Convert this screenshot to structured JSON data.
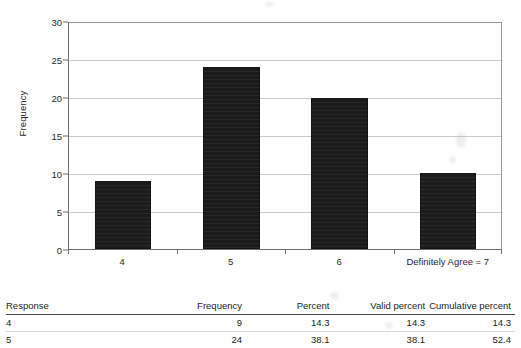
{
  "chart_data": {
    "type": "bar",
    "title": "",
    "xlabel": "",
    "ylabel": "Frequency",
    "categories": [
      "4",
      "5",
      "6",
      "Definitely Agree = 7"
    ],
    "values": [
      9,
      24,
      20,
      10
    ],
    "ylim": [
      0,
      30
    ],
    "yticks": [
      0,
      5,
      10,
      15,
      20,
      25,
      30
    ],
    "ytick_labels": [
      "0",
      "5",
      "10",
      "15",
      "20",
      "25",
      "30"
    ],
    "grid": true,
    "legend": "none",
    "bar_color": "#1b1b1b",
    "gridline_color": "#c9c9c9",
    "axis_color": "#6e6e6e"
  },
  "table": {
    "headers": [
      "Response",
      "Frequency",
      "Percent",
      "Valid percent",
      "Cumulative percent"
    ],
    "rows": [
      {
        "response": "4",
        "frequency": "9",
        "percent": "14.3",
        "valid_percent": "14.3",
        "cumulative_percent": "14.3"
      },
      {
        "response": "5",
        "frequency": "24",
        "percent": "38.1",
        "valid_percent": "38.1",
        "cumulative_percent": "52.4"
      }
    ]
  }
}
